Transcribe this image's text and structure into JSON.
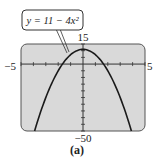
{
  "caption": "(a)",
  "chart_data": {
    "type": "line",
    "title": "",
    "equation_label": "y = 11 − 4x²",
    "function": "11 - 4*x^2",
    "xlabel": "",
    "ylabel": "",
    "xlim": [
      -5,
      5
    ],
    "ylim": [
      -50,
      15
    ],
    "xscale": 1,
    "yscale": 5,
    "tick_labels": {
      "xmin": "−5",
      "xmax": "5",
      "ymax": "15",
      "ymin": "−50"
    },
    "grid": false,
    "x": [
      -3.06,
      -3,
      -2.5,
      -2,
      -1.5,
      -1,
      -0.5,
      0,
      0.5,
      1,
      1.5,
      2,
      2.5,
      3,
      3.06
    ],
    "y": [
      -26.4,
      -25,
      -14,
      -5,
      2,
      7,
      10,
      11,
      10,
      7,
      2,
      -5,
      -14,
      -25,
      -26.4
    ],
    "vertex": {
      "x": 0,
      "y": 11
    },
    "plot_background": "#d9d9d9",
    "curve_color": "#1a1a1a"
  },
  "colors": {
    "plot_bg": "#d9d9d9",
    "frame": "#555555",
    "axis": "#333333",
    "curve": "#1a1a1a",
    "label_box_bg": "#ffffff"
  }
}
